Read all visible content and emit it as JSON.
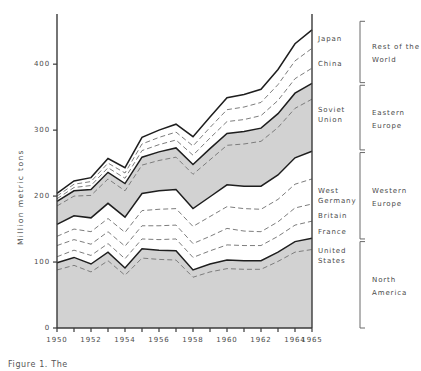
{
  "chart_data": {
    "type": "area",
    "title": "",
    "xlabel": "",
    "ylabel": "Million metric tons",
    "xlim": [
      1950,
      1965
    ],
    "ylim": [
      0,
      470
    ],
    "yticks": [
      0,
      100,
      200,
      300,
      400
    ],
    "ytick_labels": [
      "0",
      "100",
      "200",
      "300",
      "400"
    ],
    "xticks": [
      1950,
      1951,
      1952,
      1953,
      1954,
      1955,
      1956,
      1957,
      1958,
      1959,
      1960,
      1961,
      1962,
      1963,
      1964,
      1965
    ],
    "xtick_labels": [
      "1950",
      "",
      "1952",
      "",
      "1954",
      "",
      "1956",
      "",
      "1958",
      "",
      "1960",
      "",
      "1962",
      "",
      "1964",
      "1965"
    ],
    "grid": false,
    "legend": "right-side-brackets",
    "x": [
      1950,
      1951,
      1952,
      1953,
      1954,
      1955,
      1956,
      1957,
      1958,
      1959,
      1960,
      1961,
      1962,
      1963,
      1964,
      1965
    ],
    "series": [
      {
        "name": "United States",
        "group": "North America",
        "fill": "gray",
        "line": "dashed",
        "values": [
          88,
          95,
          85,
          102,
          80,
          106,
          104,
          103,
          77,
          85,
          90,
          89,
          89,
          101,
          115,
          119
        ]
      },
      {
        "name": "North America",
        "group": "North America",
        "fill": "gray",
        "line": "solid",
        "values": [
          99,
          107,
          97,
          115,
          91,
          120,
          118,
          117,
          88,
          97,
          103,
          102,
          102,
          115,
          131,
          136
        ]
      },
      {
        "name": "France",
        "group": "Western Europe",
        "fill": "white",
        "line": "dashed",
        "values": [
          108,
          118,
          110,
          128,
          105,
          135,
          134,
          135,
          107,
          117,
          126,
          125,
          125,
          139,
          156,
          162
        ]
      },
      {
        "name": "Britain",
        "group": "Western Europe",
        "fill": "white",
        "line": "dashed",
        "values": [
          125,
          134,
          127,
          146,
          124,
          155,
          155,
          156,
          128,
          139,
          151,
          147,
          146,
          161,
          182,
          188
        ]
      },
      {
        "name": "West Germany",
        "group": "Western Europe",
        "fill": "white",
        "line": "dashed",
        "values": [
          139,
          150,
          146,
          166,
          145,
          178,
          180,
          181,
          154,
          169,
          184,
          181,
          180,
          195,
          218,
          226
        ]
      },
      {
        "name": "Western Europe",
        "group": "Western Europe",
        "fill": "white",
        "line": "solid",
        "values": [
          157,
          170,
          167,
          189,
          168,
          204,
          208,
          210,
          181,
          199,
          217,
          215,
          215,
          232,
          258,
          268
        ]
      },
      {
        "name": "Soviet Union",
        "group": "Eastern Europe",
        "fill": "gray",
        "line": "dashed",
        "values": [
          185,
          200,
          201,
          226,
          208,
          247,
          254,
          259,
          233,
          255,
          277,
          279,
          283,
          304,
          333,
          347
        ]
      },
      {
        "name": "Eastern Europe",
        "group": "Eastern Europe",
        "fill": "gray",
        "line": "solid",
        "values": [
          192,
          208,
          210,
          236,
          219,
          259,
          267,
          273,
          248,
          272,
          295,
          298,
          303,
          325,
          356,
          371
        ]
      },
      {
        "name": "China",
        "group": "Rest of the World",
        "fill": "white",
        "line": "dashed",
        "values": [
          196,
          213,
          216,
          243,
          227,
          269,
          278,
          285,
          262,
          288,
          313,
          316,
          322,
          345,
          378,
          394
        ]
      },
      {
        "name": "Japan",
        "group": "Rest of the World",
        "fill": "white",
        "line": "dashed",
        "values": [
          200,
          218,
          222,
          250,
          235,
          279,
          289,
          297,
          276,
          304,
          331,
          335,
          342,
          369,
          405,
          424
        ]
      },
      {
        "name": "Rest of the World",
        "group": "Rest of the World",
        "fill": "white",
        "line": "solid",
        "values": [
          204,
          223,
          228,
          257,
          243,
          289,
          300,
          309,
          290,
          320,
          349,
          354,
          362,
          392,
          431,
          452
        ]
      }
    ],
    "inner_labels": [
      {
        "text": "Japan",
        "value": 438
      },
      {
        "text": "China",
        "value": 400
      },
      {
        "text": "Soviet\nUnion",
        "value": 330
      },
      {
        "text": "West\nGermany",
        "value": 208
      },
      {
        "text": "Britain",
        "value": 170
      },
      {
        "text": "France",
        "value": 146
      },
      {
        "text": "United\nStates",
        "value": 116
      }
    ],
    "group_brackets": [
      {
        "text": "Rest of the\nWorld",
        "from": 372,
        "to": 465
      },
      {
        "text": "Eastern\nEurope",
        "from": 270,
        "to": 368
      },
      {
        "text": "Western\nEurope",
        "from": 135,
        "to": 266
      },
      {
        "text": "North\nAmerica",
        "from": 0,
        "to": 131
      }
    ],
    "colors": {
      "band_gray": "#d2d2d2",
      "band_white": "#ffffff",
      "line": "#1e1e1e",
      "dashed_line": "#7d7d7d",
      "axis": "#3a3a3a",
      "text": "#4a4a4a"
    }
  },
  "axis": {
    "y_title": "Million metric tons",
    "y_ticks": [
      "400",
      "300",
      "200",
      "100",
      "0"
    ],
    "x_ticks": [
      "1950",
      "1952",
      "1954",
      "1956",
      "1958",
      "1960",
      "1962",
      "1964",
      "1965"
    ]
  },
  "inner_legend": {
    "japan": "Japan",
    "china": "China",
    "soviet_union_l1": "Soviet",
    "soviet_union_l2": "Union",
    "west_germany_l1": "West",
    "west_germany_l2": "Germany",
    "britain": "Britain",
    "france": "France",
    "united_states_l1": "United",
    "united_states_l2": "States"
  },
  "outer_legend": {
    "rest_of_world_l1": "Rest of the",
    "rest_of_world_l2": "World",
    "eastern_europe_l1": "Eastern",
    "eastern_europe_l2": "Europe",
    "western_europe_l1": "Western",
    "western_europe_l2": "Europe",
    "north_america_l1": "North",
    "north_america_l2": "America"
  },
  "caption": {
    "text": "Figure 1. The"
  }
}
